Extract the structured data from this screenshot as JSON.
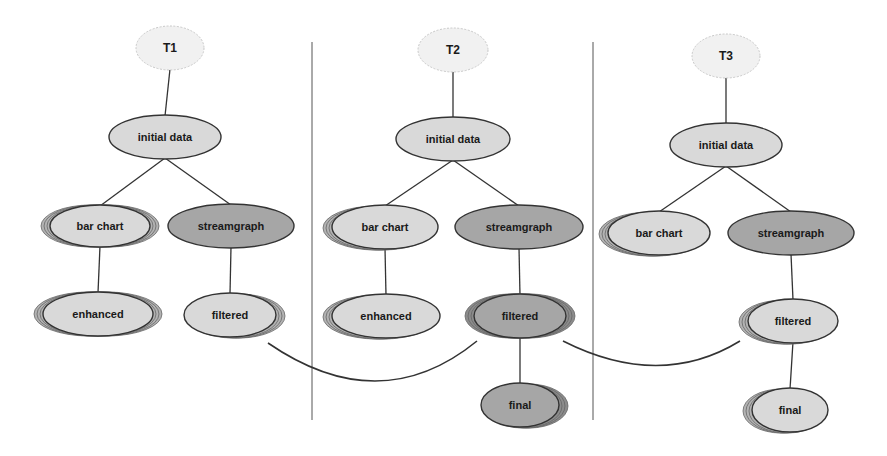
{
  "diagram": {
    "type": "version-tree timeline",
    "colors": {
      "background": "#ffffff",
      "root_fill": "#f1f1f1",
      "light_fill": "#d9d9d9",
      "dark_fill": "#a6a6a6",
      "stroke": "#333333",
      "divider": "#555555"
    },
    "panels": [
      {
        "id": "T1",
        "nodes": [
          {
            "id": "t1-root",
            "label": "T1",
            "style": "root",
            "cx": 170,
            "cy": 48,
            "rx": 34,
            "ry": 22,
            "stack": 0
          },
          {
            "id": "t1-initial",
            "label": "initial data",
            "style": "light",
            "cx": 165,
            "cy": 137,
            "rx": 56,
            "ry": 22,
            "stack": 0
          },
          {
            "id": "t1-bar",
            "label": "bar chart",
            "style": "light",
            "cx": 100,
            "cy": 226,
            "rx": 50,
            "ry": 21,
            "stack": 3,
            "stack_dir": "both"
          },
          {
            "id": "t1-stream",
            "label": "streamgraph",
            "style": "dark",
            "cx": 231,
            "cy": 226,
            "rx": 63,
            "ry": 22,
            "stack": 0
          },
          {
            "id": "t1-enhanced",
            "label": "enhanced",
            "style": "light",
            "cx": 98,
            "cy": 314,
            "rx": 55,
            "ry": 22,
            "stack": 3,
            "stack_dir": "both"
          },
          {
            "id": "t1-filtered",
            "label": "filtered",
            "style": "light",
            "cx": 230,
            "cy": 315,
            "rx": 46,
            "ry": 22,
            "stack": 3,
            "stack_dir": "right"
          }
        ],
        "edges": [
          [
            "t1-root",
            "t1-initial"
          ],
          [
            "t1-initial",
            "t1-bar"
          ],
          [
            "t1-initial",
            "t1-stream"
          ],
          [
            "t1-bar",
            "t1-enhanced"
          ],
          [
            "t1-stream",
            "t1-filtered"
          ]
        ]
      },
      {
        "id": "T2",
        "nodes": [
          {
            "id": "t2-root",
            "label": "T2",
            "style": "root",
            "cx": 453,
            "cy": 50,
            "rx": 35,
            "ry": 22,
            "stack": 0
          },
          {
            "id": "t2-initial",
            "label": "initial data",
            "style": "light",
            "cx": 453,
            "cy": 139,
            "rx": 57,
            "ry": 22,
            "stack": 0
          },
          {
            "id": "t2-bar",
            "label": "bar chart",
            "style": "light",
            "cx": 385,
            "cy": 227,
            "rx": 53,
            "ry": 22,
            "stack": 3,
            "stack_dir": "left"
          },
          {
            "id": "t2-stream",
            "label": "streamgraph",
            "style": "dark",
            "cx": 519,
            "cy": 227,
            "rx": 64,
            "ry": 22,
            "stack": 0
          },
          {
            "id": "t2-enhanced",
            "label": "enhanced",
            "style": "light",
            "cx": 386,
            "cy": 316,
            "rx": 54,
            "ry": 22,
            "stack": 3,
            "stack_dir": "left"
          },
          {
            "id": "t2-filtered",
            "label": "filtered",
            "style": "dark",
            "cx": 520,
            "cy": 316,
            "rx": 46,
            "ry": 22,
            "stack": 3,
            "stack_dir": "both"
          },
          {
            "id": "t2-final",
            "label": "final",
            "style": "dark",
            "cx": 520,
            "cy": 405,
            "rx": 39,
            "ry": 22,
            "stack": 3,
            "stack_dir": "right"
          }
        ],
        "edges": [
          [
            "t2-root",
            "t2-initial"
          ],
          [
            "t2-initial",
            "t2-bar"
          ],
          [
            "t2-initial",
            "t2-stream"
          ],
          [
            "t2-bar",
            "t2-enhanced"
          ],
          [
            "t2-stream",
            "t2-filtered"
          ],
          [
            "t2-filtered",
            "t2-final"
          ]
        ]
      },
      {
        "id": "T3",
        "nodes": [
          {
            "id": "t3-root",
            "label": "T3",
            "style": "root",
            "cx": 726,
            "cy": 56,
            "rx": 34,
            "ry": 22,
            "stack": 0
          },
          {
            "id": "t3-initial",
            "label": "initial data",
            "style": "light",
            "cx": 726,
            "cy": 145,
            "rx": 56,
            "ry": 22,
            "stack": 0
          },
          {
            "id": "t3-bar",
            "label": "bar chart",
            "style": "light",
            "cx": 659,
            "cy": 233,
            "rx": 51,
            "ry": 22,
            "stack": 3,
            "stack_dir": "left"
          },
          {
            "id": "t3-stream",
            "label": "streamgraph",
            "style": "dark",
            "cx": 791,
            "cy": 233,
            "rx": 63,
            "ry": 22,
            "stack": 0
          },
          {
            "id": "t3-filtered",
            "label": "filtered",
            "style": "light",
            "cx": 793,
            "cy": 321,
            "rx": 45,
            "ry": 22,
            "stack": 3,
            "stack_dir": "left"
          },
          {
            "id": "t3-final",
            "label": "final",
            "style": "light",
            "cx": 790,
            "cy": 410,
            "rx": 38,
            "ry": 22,
            "stack": 3,
            "stack_dir": "left"
          }
        ],
        "edges": [
          [
            "t3-root",
            "t3-initial"
          ],
          [
            "t3-initial",
            "t3-bar"
          ],
          [
            "t3-initial",
            "t3-stream"
          ],
          [
            "t3-stream",
            "t3-filtered"
          ],
          [
            "t3-filtered",
            "t3-final"
          ]
        ]
      }
    ],
    "dividers": [
      {
        "x": 312,
        "y1": 42,
        "y2": 420
      },
      {
        "x": 593,
        "y1": 42,
        "y2": 420
      }
    ],
    "cross_links": [
      {
        "from": "t1-filtered",
        "to": "t2-filtered",
        "path": "M 268 343 Q 380 420 477 341"
      },
      {
        "from": "t2-filtered",
        "to": "t3-filtered",
        "path": "M 563 341 Q 660 390 740 341"
      }
    ]
  }
}
